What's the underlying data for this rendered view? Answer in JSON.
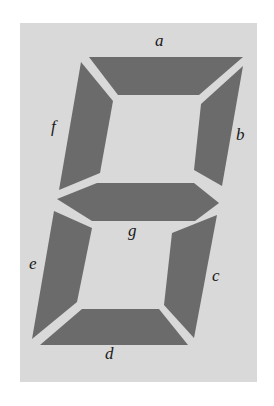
{
  "diagram": {
    "colors": {
      "background": "#ffffff",
      "panel": "#d9d9d9",
      "segment": "#6b6b6b",
      "label": "#1a1a1a"
    },
    "segments": [
      {
        "id": "a",
        "label": "a",
        "points": "89,57 243,57 199,95 118,95"
      },
      {
        "id": "b",
        "label": "b",
        "points": "243,66 222,186 194,170 201,104"
      },
      {
        "id": "c",
        "label": "c",
        "points": "217,215 194,338 164,305 172,233"
      },
      {
        "id": "d",
        "label": "d",
        "points": "82,309 159,309 188,345 40,345"
      },
      {
        "id": "e",
        "label": "e",
        "points": "54,211 92,228 77,302 32,339"
      },
      {
        "id": "f",
        "label": "f",
        "points": "81,62 113,101 100,173 59,190"
      },
      {
        "id": "g",
        "label": "g",
        "points": "57,199 97,183 194,183 219,203 195,221 92,221"
      }
    ],
    "labels": {
      "a": "a",
      "b": "b",
      "c": "c",
      "d": "d",
      "e": "e",
      "f": "f",
      "g": "g"
    }
  }
}
